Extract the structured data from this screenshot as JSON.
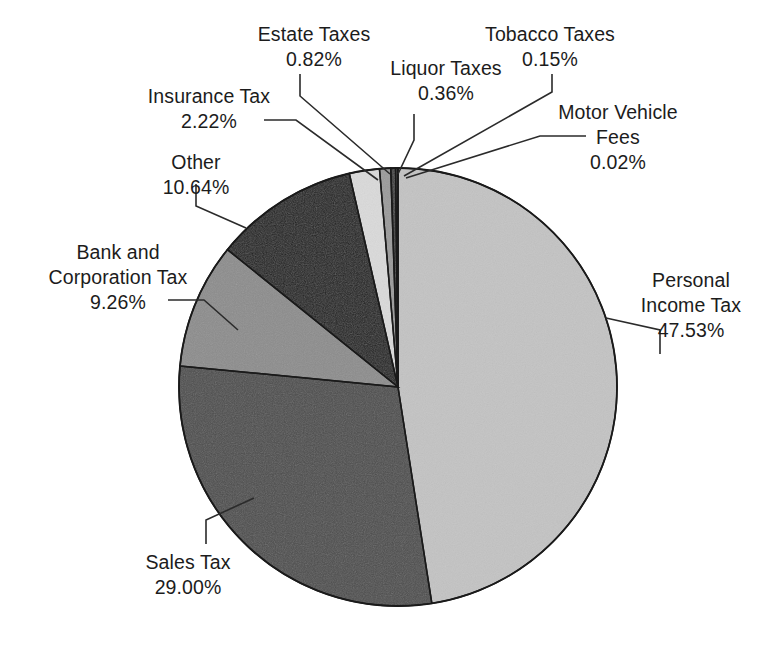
{
  "chart_data": {
    "type": "pie",
    "title": "",
    "units": "percent",
    "start_angle_deg": 0,
    "direction": "clockwise",
    "center": {
      "x": 398,
      "y": 387
    },
    "radius": 219,
    "slices": [
      {
        "label": "Personal Income Tax",
        "label_lines": [
          "Personal",
          "Income Tax"
        ],
        "value": 47.53,
        "value_text": "47.53%",
        "color": "#c3c3c3"
      },
      {
        "label": "Sales Tax",
        "label_lines": [
          "Sales Tax"
        ],
        "value": 29.0,
        "value_text": "29.00%",
        "color": "#4d4d4d"
      },
      {
        "label": "Bank and Corporation Tax",
        "label_lines": [
          "Bank and",
          "Corporation Tax"
        ],
        "value": 9.26,
        "value_text": "9.26%",
        "color": "#8c8c8c"
      },
      {
        "label": "Other",
        "label_lines": [
          "Other"
        ],
        "value": 10.64,
        "value_text": "10.64%",
        "color": "#1e1e1e"
      },
      {
        "label": "Insurance Tax",
        "label_lines": [
          "Insurance Tax"
        ],
        "value": 2.22,
        "value_text": "2.22%",
        "color": "#dadada"
      },
      {
        "label": "Estate Taxes",
        "label_lines": [
          "Estate Taxes"
        ],
        "value": 0.82,
        "value_text": "0.82%",
        "color": "#9a9a9a"
      },
      {
        "label": "Liquor Taxes",
        "label_lines": [
          "Liquor Taxes"
        ],
        "value": 0.36,
        "value_text": "0.36%",
        "color": "#3a3a3a"
      },
      {
        "label": "Tobacco Taxes",
        "label_lines": [
          "Tobacco Taxes"
        ],
        "value": 0.15,
        "value_text": "0.15%",
        "color": "#7a7a7a"
      },
      {
        "label": "Motor Vehicle Fees",
        "label_lines": [
          "Motor Vehicle",
          "Fees"
        ],
        "value": 0.02,
        "value_text": "0.02%",
        "color": "#2a2a2a"
      }
    ],
    "legend_position": "callout-labels",
    "grid": false
  },
  "labels": {
    "estate": {
      "line1": "Estate Taxes",
      "line2": "0.82%"
    },
    "liquor": {
      "line1": "Liquor Taxes",
      "line2": "0.36%"
    },
    "tobacco": {
      "line1": "Tobacco Taxes",
      "line2": "0.15%"
    },
    "insurance": {
      "line1": "Insurance Tax",
      "line2": "2.22%"
    },
    "motor": {
      "line1": "Motor Vehicle",
      "line2": "Fees",
      "line3": "0.02%"
    },
    "other": {
      "line1": "Other",
      "line2": "10.64%"
    },
    "bank": {
      "line1": "Bank and",
      "line2": "Corporation Tax",
      "line3": "9.26%"
    },
    "personal": {
      "line1": "Personal",
      "line2": "Income Tax",
      "line3": "47.53%"
    },
    "sales": {
      "line1": "Sales Tax",
      "line2": "29.00%"
    }
  },
  "style": {
    "background": "#ffffff",
    "outline": "#1a1a1a",
    "leader_line": "#2b2b2b",
    "text": "#1c1c1c"
  }
}
